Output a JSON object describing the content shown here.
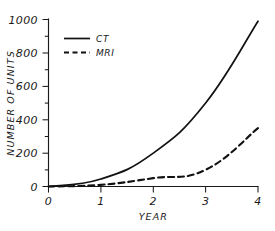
{
  "chart_data": {
    "type": "line",
    "title": "",
    "xlabel": "YEAR",
    "ylabel": "NUMBER OF UNITS",
    "x": [
      0,
      1,
      2,
      3,
      4
    ],
    "xlim": [
      0,
      4
    ],
    "ylim": [
      0,
      1000
    ],
    "xticks": [
      "0",
      "1",
      "2",
      "3",
      "4"
    ],
    "yticks": [
      "0",
      "200",
      "400",
      "600",
      "800",
      "1000"
    ],
    "ytick_minor_step": 100,
    "grid": false,
    "legend_position": "upper-left",
    "series": [
      {
        "name": "CT",
        "style": "solid",
        "color": "#111111",
        "values": [
          0,
          45,
          200,
          500,
          990
        ]
      },
      {
        "name": "MRI",
        "style": "dashed",
        "color": "#111111",
        "values": [
          0,
          10,
          50,
          100,
          350
        ]
      }
    ]
  },
  "axes": {
    "y_title": "NUMBER OF UNITS",
    "x_title": "YEAR",
    "y_tick_labels": [
      "1000",
      "800",
      "600",
      "400",
      "200",
      "0"
    ],
    "x_tick_labels": [
      "0",
      "1",
      "2",
      "3",
      "4"
    ]
  },
  "legend": {
    "entries": [
      {
        "label": "CT",
        "style": "solid"
      },
      {
        "label": "MRI",
        "style": "dashed"
      }
    ]
  }
}
